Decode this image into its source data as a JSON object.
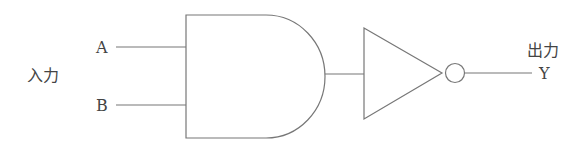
{
  "diagram": {
    "type": "logic-gate-circuit",
    "gates": [
      "AND",
      "NOT"
    ],
    "inputs_group_label": "入力",
    "input_a": "A",
    "input_b": "B",
    "output_group_label": "出力",
    "output_y": "Y",
    "stroke_color": "#777777"
  }
}
